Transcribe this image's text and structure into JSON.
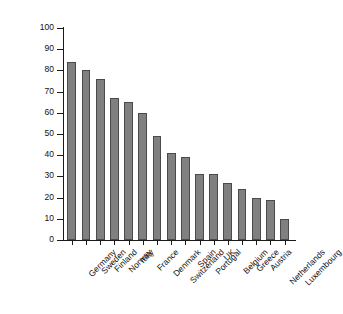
{
  "chart_data": {
    "type": "bar",
    "title": "",
    "subtitle": "",
    "xlabel": "",
    "ylabel": "% of total tourist nights by nationals 1995",
    "ylim": [
      0,
      100
    ],
    "yticks": [
      "0",
      "10",
      "20",
      "30",
      "40",
      "50",
      "60",
      "70",
      "80",
      "90",
      "100"
    ],
    "grid": false,
    "legend": null,
    "orientation": "vertical",
    "bar_color": "#808080",
    "bar_edge_color": "#4a4a4a",
    "background_color": "#ffffff",
    "axis_color": "#1a1a1a",
    "categories": [
      "Germany",
      "Sweden",
      "Finland",
      "Norway",
      "Italy",
      "France",
      "Denmark",
      "Switzerland",
      "Spain",
      "Portugal",
      "UK",
      "Belgium",
      "Greece",
      "Austria",
      "Netherlands",
      "Luxembourg"
    ],
    "values": [
      84,
      80,
      76,
      67,
      65,
      60,
      49,
      41,
      39,
      31,
      31,
      27,
      24,
      20,
      19,
      10
    ]
  }
}
